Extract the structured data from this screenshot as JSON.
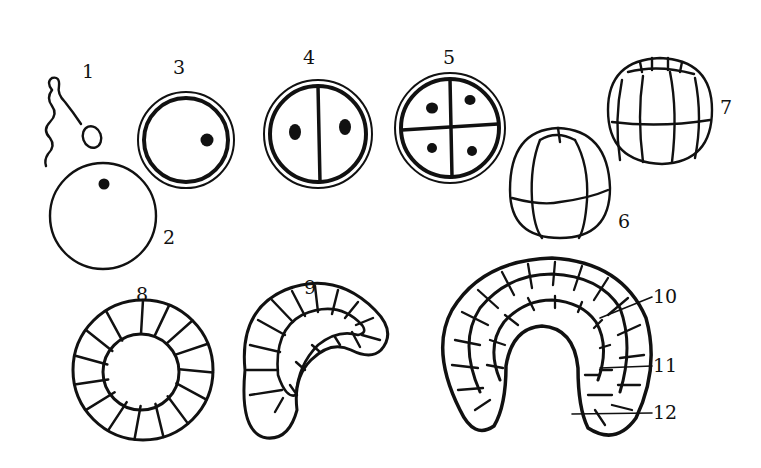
{
  "figure": {
    "labels": [
      {
        "id": "1",
        "text": "1",
        "x": 82,
        "y": 62
      },
      {
        "id": "2",
        "text": "2",
        "x": 163,
        "y": 228
      },
      {
        "id": "3",
        "text": "3",
        "x": 173,
        "y": 58
      },
      {
        "id": "4",
        "text": "4",
        "x": 303,
        "y": 48
      },
      {
        "id": "5",
        "text": "5",
        "x": 443,
        "y": 48
      },
      {
        "id": "6",
        "text": "6",
        "x": 618,
        "y": 212
      },
      {
        "id": "7",
        "text": "7",
        "x": 720,
        "y": 98
      },
      {
        "id": "8",
        "text": "8",
        "x": 136,
        "y": 285
      },
      {
        "id": "9",
        "text": "9",
        "x": 304,
        "y": 278
      },
      {
        "id": "10",
        "text": "10",
        "x": 653,
        "y": 287
      },
      {
        "id": "11",
        "text": "11",
        "x": 653,
        "y": 356
      },
      {
        "id": "12",
        "text": "12",
        "x": 653,
        "y": 403
      }
    ]
  }
}
